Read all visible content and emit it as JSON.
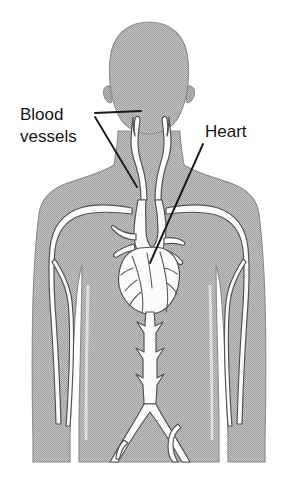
{
  "figure": {
    "name": "human-circulatory-system-diagram",
    "background_color": "#ffffff",
    "body_fill_color": "#b0b0b0",
    "body_outline_color": "#8a8a8a",
    "vessel_fill_color": "#fbfbfb",
    "vessel_outline_color": "#4a4a4a",
    "leader_line_color": "#1a1a1a",
    "text_color": "#151515",
    "font_size_px": 17
  },
  "labels": [
    {
      "id": "blood-vessels",
      "name": "blood-vessels-label",
      "lines": [
        "Blood",
        "vessels"
      ],
      "line1": "Blood",
      "line2": "vessels",
      "text_x": 20,
      "line1_y": 120,
      "line2_y": 142,
      "leaders": [
        {
          "x1": 93,
          "y1": 114,
          "x2": 140,
          "y2": 112
        },
        {
          "x1": 93,
          "y1": 118,
          "x2": 137,
          "y2": 186
        }
      ]
    },
    {
      "id": "heart",
      "name": "heart-label",
      "lines": [
        "Heart"
      ],
      "line1": "Heart",
      "text_x": 205,
      "line1_y": 137,
      "leaders": [
        {
          "x1": 203,
          "y1": 143,
          "x2": 151,
          "y2": 262
        }
      ]
    }
  ],
  "anatomy_parts": [
    {
      "id": "body-silhouette",
      "name": "body-silhouette",
      "label": "Human torso, head and arms silhouette"
    },
    {
      "id": "head",
      "name": "head-silhouette",
      "label": "Head"
    },
    {
      "id": "left-ear",
      "name": "left-ear-shape",
      "label": "Left ear"
    },
    {
      "id": "right-ear",
      "name": "right-ear-shape",
      "label": "Right ear"
    },
    {
      "id": "carotid-left",
      "name": "carotid-artery-left",
      "label": "Left carotid artery with bifurcation"
    },
    {
      "id": "carotid-right",
      "name": "carotid-artery-right",
      "label": "Right carotid artery with bifurcation"
    },
    {
      "id": "subclavian-left",
      "name": "subclavian-artery-left",
      "label": "Left subclavian and arm arteries"
    },
    {
      "id": "subclavian-right",
      "name": "subclavian-artery-right",
      "label": "Right subclavian and arm arteries"
    },
    {
      "id": "aortic-arch",
      "name": "aortic-arch",
      "label": "Aortic arch and great vessels"
    },
    {
      "id": "heart-organ",
      "name": "heart-organ",
      "label": "Heart with coronary arteries"
    },
    {
      "id": "descending-aorta",
      "name": "descending-aorta",
      "label": "Descending aorta with lumbar branches"
    },
    {
      "id": "iliac-arteries",
      "name": "iliac-arteries",
      "label": "Iliac artery bifurcation"
    }
  ]
}
